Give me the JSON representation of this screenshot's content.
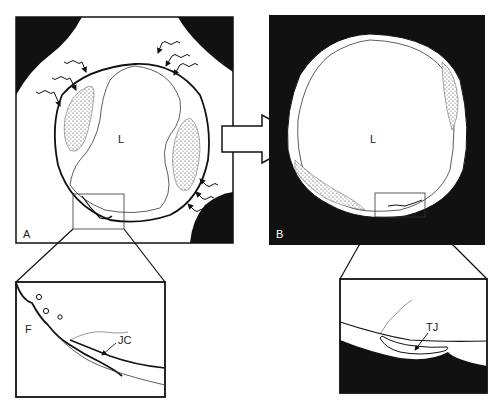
{
  "figure": {
    "panel_a": {
      "label": "A",
      "lumen_label": "L"
    },
    "panel_b": {
      "label": "B",
      "lumen_label": "L"
    },
    "inset_a": {
      "labels": {
        "fenestration": "F",
        "junction": "JC"
      }
    },
    "inset_b": {
      "labels": {
        "junction": "TJ"
      }
    },
    "arrow": "transition-arrow"
  },
  "colors": {
    "background": "#ffffff",
    "ink": "#111111",
    "stipple": "#555555"
  }
}
